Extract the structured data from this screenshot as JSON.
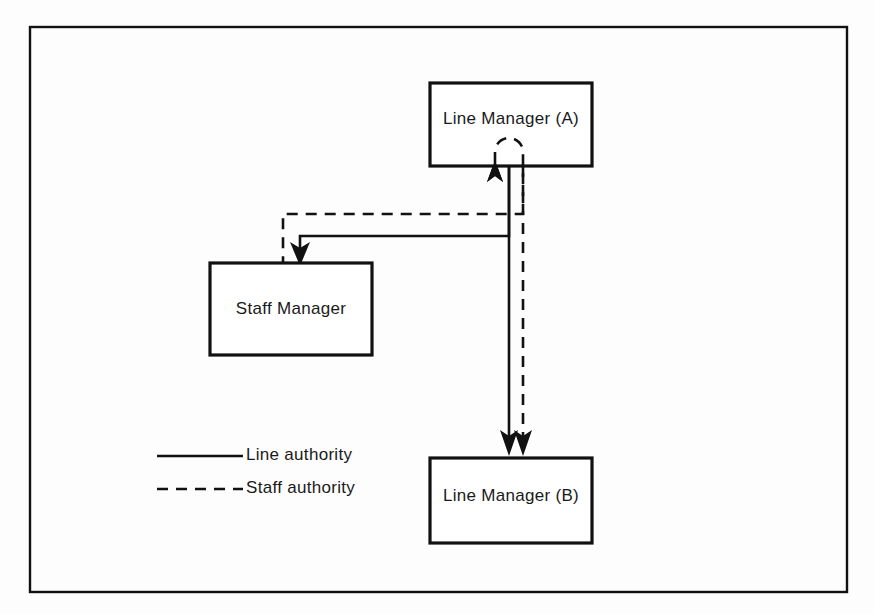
{
  "diagram": {
    "nodes": [
      {
        "id": "line-manager-a",
        "label": "Line Manager (A)",
        "x": 430,
        "y": 83,
        "width": 162,
        "height": 83
      },
      {
        "id": "staff-manager",
        "label": "Staff Manager",
        "x": 210,
        "y": 263,
        "width": 162,
        "height": 92
      },
      {
        "id": "line-manager-b",
        "label": "Line Manager (B)",
        "x": 430,
        "y": 458,
        "width": 162,
        "height": 85
      }
    ],
    "connectors": [
      {
        "id": "a-to-staff-line",
        "style": "solid",
        "from": "line-manager-a",
        "to": "staff-manager",
        "authority": "Line authority"
      },
      {
        "id": "a-to-staff-staff",
        "style": "dashed",
        "from": "line-manager-a",
        "to": "staff-manager",
        "authority": "Staff authority"
      },
      {
        "id": "a-to-b-line",
        "style": "solid",
        "from": "line-manager-a",
        "to": "line-manager-b",
        "authority": "Line authority"
      },
      {
        "id": "a-to-b-staff",
        "style": "dashed",
        "from": "line-manager-a",
        "to": "line-manager-b",
        "authority": "Staff authority"
      },
      {
        "id": "staff-loop-to-a",
        "style": "dashed",
        "from": "staff-manager",
        "to": "line-manager-a",
        "authority": "Staff authority"
      }
    ],
    "legend": {
      "items": [
        {
          "id": "legend-line-authority",
          "label": "Line authority",
          "style": "solid",
          "color": "#111111"
        },
        {
          "id": "legend-staff-authority",
          "label": "Staff authority",
          "style": "dashed",
          "color": "#111111"
        }
      ]
    },
    "colors": {
      "stroke": "#111111",
      "node_fill": "#ffffff",
      "background": "#fdfdfd",
      "text": "#1a1a1a"
    }
  }
}
